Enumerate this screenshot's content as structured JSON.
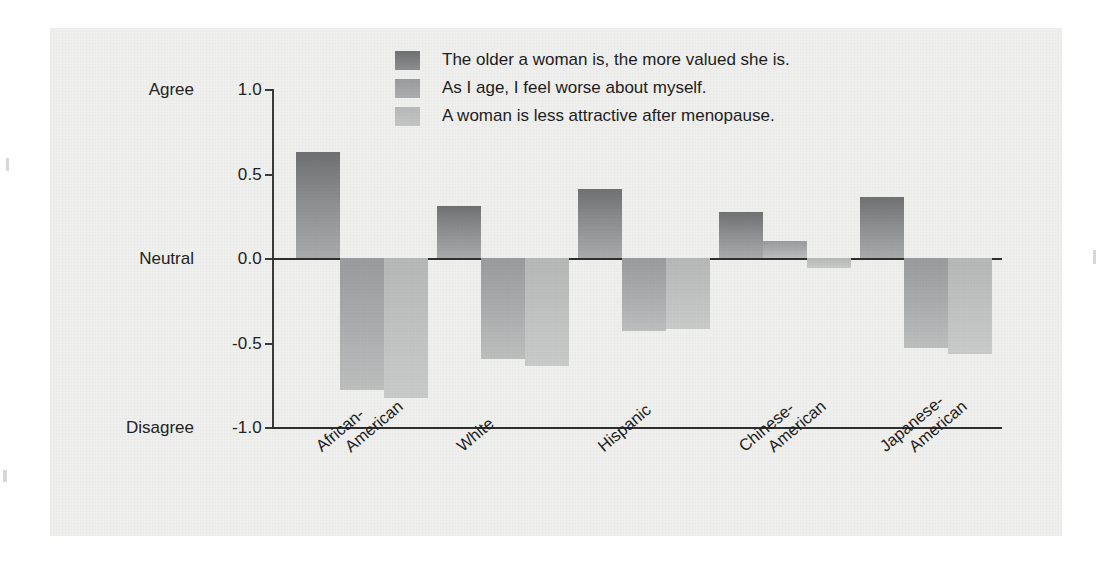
{
  "chart_data": {
    "type": "bar",
    "title": "",
    "subtitle": "",
    "xlabel": "",
    "ylabel": "",
    "ylim": [
      -1.0,
      1.0
    ],
    "grid": false,
    "legend_position": "top-center",
    "categories": [
      "African-American",
      "White",
      "Hispanic",
      "Chinese-American",
      "Japanese-American"
    ],
    "category_lines": [
      [
        "African-",
        "American"
      ],
      [
        "White",
        ""
      ],
      [
        "Hispanic",
        ""
      ],
      [
        "Chinese-",
        "American"
      ],
      [
        "Japanese-",
        "American"
      ]
    ],
    "series": [
      {
        "name": "The older a woman is, the more valued she is.",
        "color": "#7d7e7f",
        "values": [
          0.63,
          0.31,
          0.41,
          0.27,
          0.36
        ]
      },
      {
        "name": "As I age, I feel worse about myself.",
        "color": "#a4a5a6",
        "values": [
          -0.78,
          -0.6,
          -0.43,
          0.1,
          -0.53
        ]
      },
      {
        "name": "A woman is less attractive after menopause.",
        "color": "#bfc0c0",
        "values": [
          -0.83,
          -0.64,
          -0.42,
          -0.06,
          -0.57
        ]
      }
    ],
    "y_ticks": [
      {
        "value": 1.0,
        "num": "1.0",
        "word": "Agree"
      },
      {
        "value": 0.5,
        "num": "0.5",
        "word": ""
      },
      {
        "value": 0.0,
        "num": "0.0",
        "word": "Neutral"
      },
      {
        "value": -0.5,
        "num": "-0.5",
        "word": ""
      },
      {
        "value": -1.0,
        "num": "-1.0",
        "word": "Disagree"
      }
    ]
  },
  "legend": {
    "items": [
      {
        "label": "The older a woman is, the more valued she is."
      },
      {
        "label": "As I age, I feel worse about myself."
      },
      {
        "label": "A woman is less attractive after menopause."
      }
    ]
  },
  "colors": {
    "panel_background": "#efefee",
    "page_background": "#ffffff",
    "axis": "#2f2f2f",
    "text": "#1d1d1d",
    "series_dark": "#7d7e7f",
    "series_mid": "#a4a5a6",
    "series_light": "#bfc0c0"
  }
}
